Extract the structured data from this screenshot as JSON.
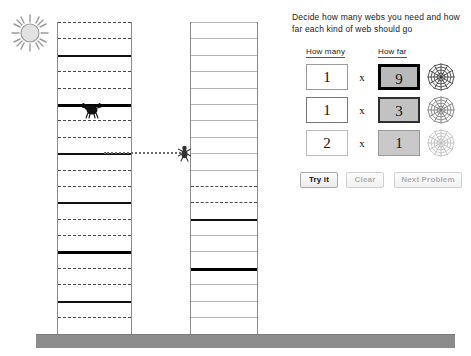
{
  "panel": {
    "instructions": "Decide how many webs you need and how far each kind of web should go",
    "header_how_many": "How many",
    "header_how_far": "How far",
    "times_symbol": "x",
    "rows": [
      {
        "how_many": "1",
        "how_far": "9",
        "web_icon": "spider-web-icon",
        "emphasis": "dark"
      },
      {
        "how_many": "1",
        "how_far": "3",
        "web_icon": "spider-web-icon",
        "emphasis": "medium"
      },
      {
        "how_many": "2",
        "how_far": "1",
        "web_icon": "spider-web-icon",
        "emphasis": "light"
      }
    ],
    "buttons": [
      {
        "label": "Try it",
        "state": "enabled"
      },
      {
        "label": "Clear",
        "state": "disabled"
      },
      {
        "label": "Next Problem",
        "state": "disabled"
      }
    ]
  },
  "scene": {
    "sun_icon": "sun-icon",
    "ground_color": "#8c8c8c",
    "spider_left_icon": "spider-icon",
    "spider_right_icon": "spider-icon",
    "travel_line": "dotted-web-path",
    "tower_left": {
      "name": "left-tower",
      "rungs": [
        {
          "y": 0,
          "style": "dashed"
        },
        {
          "y": 22,
          "style": "dashed"
        },
        {
          "y": 44,
          "style": "solid"
        },
        {
          "y": 66,
          "style": "dashed"
        },
        {
          "y": 88,
          "style": "dashed"
        },
        {
          "y": 110,
          "style": "thick"
        },
        {
          "y": 132,
          "style": "dashed"
        },
        {
          "y": 154,
          "style": "dashed"
        },
        {
          "y": 176,
          "style": "solid"
        },
        {
          "y": 198,
          "style": "dashed"
        },
        {
          "y": 220,
          "style": "dashed"
        },
        {
          "y": 242,
          "style": "solid"
        },
        {
          "y": 264,
          "style": "dashed"
        },
        {
          "y": 286,
          "style": "dashed"
        },
        {
          "y": 308,
          "style": "thick"
        },
        {
          "y": 330,
          "style": "dashed"
        },
        {
          "y": 352,
          "style": "dashed"
        },
        {
          "y": 374,
          "style": "solid"
        },
        {
          "y": 396,
          "style": "dashed"
        },
        {
          "y": 418,
          "style": "dashed"
        }
      ]
    },
    "tower_right": {
      "name": "right-tower",
      "rungs": [
        {
          "y": 0,
          "style": "thin"
        },
        {
          "y": 22,
          "style": "thin"
        },
        {
          "y": 44,
          "style": "thin"
        },
        {
          "y": 66,
          "style": "thin"
        },
        {
          "y": 88,
          "style": "thin"
        },
        {
          "y": 110,
          "style": "thin"
        },
        {
          "y": 132,
          "style": "thin"
        },
        {
          "y": 154,
          "style": "thin"
        },
        {
          "y": 176,
          "style": "thin"
        },
        {
          "y": 198,
          "style": "thin"
        },
        {
          "y": 220,
          "style": "dashed"
        },
        {
          "y": 242,
          "style": "dashed"
        },
        {
          "y": 264,
          "style": "solid"
        },
        {
          "y": 286,
          "style": "thin"
        },
        {
          "y": 308,
          "style": "thin"
        },
        {
          "y": 330,
          "style": "thick"
        },
        {
          "y": 352,
          "style": "thin"
        },
        {
          "y": 374,
          "style": "thin"
        },
        {
          "y": 396,
          "style": "thin"
        },
        {
          "y": 418,
          "style": "thin"
        }
      ]
    }
  }
}
